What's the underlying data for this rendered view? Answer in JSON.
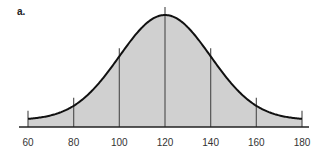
{
  "panel_label": "a.",
  "chart_data": {
    "type": "area",
    "title": "",
    "subtitle": "",
    "panel_label": "a.",
    "distribution": {
      "mean": 120,
      "sd": 20
    },
    "xlabel": "",
    "ylabel": "",
    "xlim": [
      60,
      180
    ],
    "x_ticks": [
      60,
      80,
      100,
      120,
      140,
      160,
      180
    ],
    "x_tick_labels": [
      "60",
      "80",
      "100",
      "120",
      "140",
      "160",
      "180"
    ],
    "vertical_lines_at": [
      60,
      80,
      100,
      120,
      140,
      160,
      180
    ],
    "grid": false,
    "legend": null,
    "fill_color": "#d0d0d0",
    "curve_color": "#111111",
    "line_color": "#555555"
  }
}
